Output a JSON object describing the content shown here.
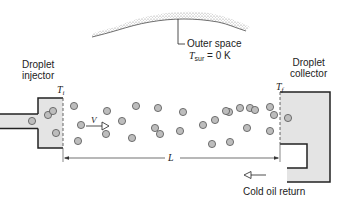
{
  "labels": {
    "outer_space": "Outer space",
    "tsur_symbol": "T",
    "tsur_sub": "sur",
    "tsur_value": " = 0 K",
    "injector_line1": "Droplet",
    "injector_line2": "injector",
    "collector_line1": "Droplet",
    "collector_line2": "collector",
    "ti_symbol": "T",
    "ti_sub": "i",
    "tf_symbol": "T",
    "tf_sub": "f",
    "velocity": "V",
    "length": "L",
    "cold_oil_return": "Cold oil return"
  },
  "colors": {
    "line": "#222222",
    "fill_gray": "#e4e4e4",
    "droplet_fill": "#bdbdbd",
    "droplet_stroke": "#555555",
    "cloud": "#9a9a9a"
  },
  "droplets": [
    {
      "x": 48,
      "y": 115
    },
    {
      "x": 53,
      "y": 111
    },
    {
      "x": 56,
      "y": 133
    },
    {
      "x": 32,
      "y": 121
    },
    {
      "x": 74,
      "y": 106
    },
    {
      "x": 81,
      "y": 125
    },
    {
      "x": 78,
      "y": 141
    },
    {
      "x": 107,
      "y": 111
    },
    {
      "x": 106,
      "y": 134
    },
    {
      "x": 122,
      "y": 121
    },
    {
      "x": 136,
      "y": 106
    },
    {
      "x": 132,
      "y": 138
    },
    {
      "x": 158,
      "y": 108
    },
    {
      "x": 155,
      "y": 128
    },
    {
      "x": 160,
      "y": 134
    },
    {
      "x": 180,
      "y": 131
    },
    {
      "x": 183,
      "y": 112
    },
    {
      "x": 203,
      "y": 125
    },
    {
      "x": 215,
      "y": 120
    },
    {
      "x": 212,
      "y": 144
    },
    {
      "x": 229,
      "y": 112
    },
    {
      "x": 230,
      "y": 142
    },
    {
      "x": 226,
      "y": 111
    },
    {
      "x": 240,
      "y": 108
    },
    {
      "x": 247,
      "y": 128
    },
    {
      "x": 250,
      "y": 108
    },
    {
      "x": 255,
      "y": 110
    },
    {
      "x": 270,
      "y": 107
    },
    {
      "x": 270,
      "y": 131
    },
    {
      "x": 274,
      "y": 115
    },
    {
      "x": 288,
      "y": 118
    }
  ]
}
